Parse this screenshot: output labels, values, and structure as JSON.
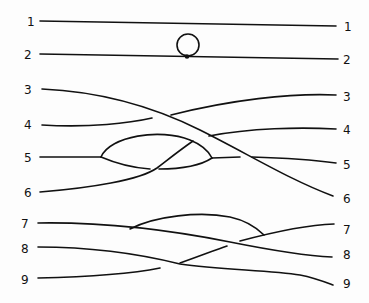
{
  "diagram": {
    "type": "string-link braid diagram",
    "left_labels": [
      "1",
      "2",
      "3",
      "4",
      "5",
      "6",
      "7",
      "8",
      "9"
    ],
    "right_labels": [
      "1",
      "2",
      "3",
      "4",
      "5",
      "6",
      "7",
      "8",
      "9"
    ],
    "ink_color": "#111111",
    "background": "#fdfdfd"
  }
}
